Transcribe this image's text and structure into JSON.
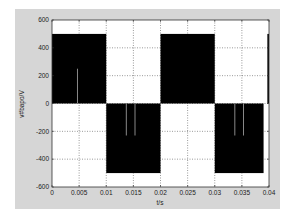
{
  "chart_data": {
    "type": "line",
    "title": "",
    "xlabel": "t/s",
    "ylabel": "v#bapo/V",
    "xlim": [
      0,
      0.04
    ],
    "ylim": [
      -600,
      600
    ],
    "grid": true,
    "legend": null,
    "x_ticks": [
      "0",
      "0.005",
      "0.01",
      "0.015",
      "0.02",
      "0.025",
      "0.03",
      "0.035",
      "0.04"
    ],
    "y_ticks": [
      "600",
      "400",
      "200",
      "0",
      "-200",
      "-400",
      "-600"
    ],
    "series": [
      {
        "name": "PWM voltage (dense switching, rendered as filled blocks)",
        "segments": [
          {
            "t_start": 0.0,
            "t_end": 0.01,
            "v_min": 0,
            "v_max": 500
          },
          {
            "t_start": 0.01,
            "t_end": 0.02,
            "v_min": -500,
            "v_max": 0
          },
          {
            "t_start": 0.02,
            "t_end": 0.03,
            "v_min": 0,
            "v_max": 500
          },
          {
            "t_start": 0.03,
            "t_end": 0.039,
            "v_min": -500,
            "v_max": 0
          },
          {
            "t_start": 0.0397,
            "t_end": 0.04,
            "v_min": 0,
            "v_max": 500
          }
        ],
        "gaps": [
          {
            "t": 0.0047,
            "from": 0,
            "to": 250
          },
          {
            "t": 0.0137,
            "from": 0,
            "to": -230
          },
          {
            "t": 0.0153,
            "from": 0,
            "to": -230
          },
          {
            "t": 0.0337,
            "from": 0,
            "to": -230
          },
          {
            "t": 0.0353,
            "from": 0,
            "to": -230
          }
        ]
      }
    ]
  },
  "colors": {
    "figure_bg": "#d6d6d6",
    "axes_bg": "#ffffff",
    "signal": "#000000",
    "grid": "#555555",
    "gap_line": "#888888"
  }
}
